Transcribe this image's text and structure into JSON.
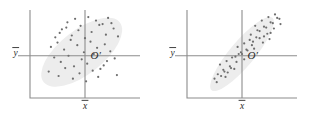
{
  "figure": {
    "title": "",
    "background_color": "#ffffff",
    "panel_count": 2
  },
  "style": {
    "axis_color": "#8c8c8c",
    "ellipse_fill": "#ededed",
    "point_color": "#6e6e6e",
    "label_color": "#2b2b2b",
    "point_radius": 1.1
  },
  "chart_data": [
    {
      "id": "left-panel",
      "type": "scatter",
      "title": "",
      "xlabel": "x̄",
      "ylabel": "ȳ",
      "xlim": [
        0,
        100
      ],
      "ylim": [
        0,
        100
      ],
      "grid": false,
      "legend": false,
      "annotations": [
        {
          "name": "origin-label",
          "text": "O′",
          "x": 55,
          "y": 44
        },
        {
          "name": "x-mean-label",
          "text": "x̄",
          "x": 50,
          "y": -12
        },
        {
          "name": "y-mean-label",
          "text": "ȳ",
          "x": -13,
          "y": 48
        }
      ],
      "mean_lines": {
        "x_mean": 50,
        "y_mean": 48
      },
      "ellipse": {
        "cx": 47,
        "cy": 52,
        "rx": 44,
        "ry": 25,
        "rotation_deg": -38
      },
      "x": [
        29,
        34,
        41,
        46,
        53,
        60,
        66,
        71,
        76,
        23,
        27,
        33,
        38,
        44,
        50,
        56,
        63,
        69,
        74,
        80,
        19,
        25,
        31,
        37,
        43,
        49,
        55,
        61,
        68,
        73,
        22,
        28,
        35,
        40,
        47,
        52,
        58,
        64,
        70,
        77,
        17,
        26,
        32,
        39,
        45,
        51,
        57,
        62,
        67,
        79
      ],
      "y": [
        78,
        86,
        90,
        82,
        92,
        88,
        84,
        91,
        79,
        69,
        74,
        80,
        71,
        77,
        68,
        75,
        83,
        72,
        85,
        70,
        58,
        63,
        55,
        66,
        60,
        52,
        64,
        57,
        61,
        53,
        46,
        41,
        48,
        36,
        44,
        39,
        50,
        33,
        42,
        45,
        30,
        25,
        34,
        22,
        28,
        19,
        31,
        24,
        37,
        26
      ]
    },
    {
      "id": "right-panel",
      "type": "scatter",
      "title": "",
      "xlabel": "x̄",
      "ylabel": "ȳ",
      "xlim": [
        0,
        100
      ],
      "ylim": [
        0,
        100
      ],
      "grid": false,
      "legend": false,
      "annotations": [
        {
          "name": "origin-label",
          "text": "O′",
          "x": 55,
          "y": 44
        },
        {
          "name": "x-mean-label",
          "text": "x̄",
          "x": 50,
          "y": -12
        },
        {
          "name": "y-mean-label",
          "text": "ȳ",
          "x": -13,
          "y": 48
        }
      ],
      "mean_lines": {
        "x_mean": 50,
        "y_mean": 48
      },
      "ellipse": {
        "cx": 50,
        "cy": 50,
        "rx": 43,
        "ry": 14,
        "rotation_deg": -50
      },
      "x": [
        62,
        68,
        74,
        80,
        66,
        72,
        78,
        84,
        70,
        76,
        58,
        64,
        70,
        76,
        82,
        60,
        66,
        73,
        79,
        85,
        46,
        52,
        57,
        63,
        49,
        54,
        59,
        44,
        50,
        55,
        30,
        36,
        41,
        47,
        33,
        39,
        45,
        28,
        34,
        40,
        25,
        31,
        37,
        43,
        27,
        35,
        52,
        61,
        69,
        75
      ],
      "y": [
        82,
        88,
        92,
        95,
        76,
        80,
        85,
        90,
        70,
        74,
        72,
        77,
        81,
        86,
        91,
        64,
        68,
        73,
        79,
        84,
        58,
        62,
        66,
        69,
        52,
        55,
        60,
        47,
        50,
        54,
        38,
        42,
        46,
        50,
        32,
        36,
        41,
        27,
        30,
        34,
        22,
        25,
        29,
        33,
        18,
        24,
        44,
        56,
        63,
        67
      ]
    }
  ]
}
